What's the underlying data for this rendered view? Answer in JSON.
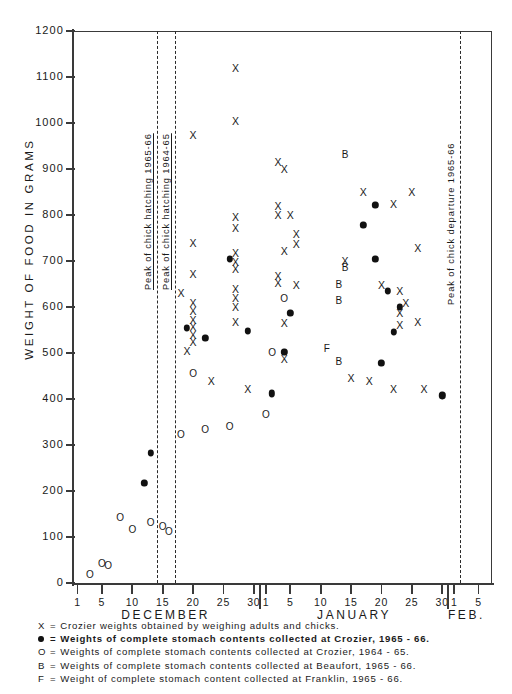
{
  "chart_data": {
    "type": "scatter",
    "title": "",
    "xlabel": "",
    "ylabel": "WEIGHT OF FOOD IN GRAMS",
    "ylim": [
      0,
      1200
    ],
    "ytick_step": 100,
    "yticks": [
      0,
      100,
      200,
      300,
      400,
      500,
      600,
      700,
      800,
      900,
      1000,
      1100,
      1200
    ],
    "ytick_labels": [
      "0",
      "100",
      "200",
      "300",
      "400",
      "500",
      "600",
      "700",
      "800",
      "900",
      "1000",
      "1100",
      "1200"
    ],
    "grid": false,
    "legend_position": "below-axes",
    "x_axis": {
      "months": [
        {
          "name": "DECEMBER",
          "ticks": [
            1,
            5,
            10,
            15,
            20,
            25,
            30
          ],
          "tick_labels": [
            "1",
            "5",
            "10",
            "15",
            "20",
            "25",
            "30"
          ]
        },
        {
          "name": "JANUARY",
          "ticks": [
            1,
            5,
            10,
            15,
            20,
            25,
            30
          ],
          "tick_labels": [
            "1",
            "5",
            "10",
            "15",
            "20",
            "25",
            "30"
          ]
        },
        {
          "name": "FEB.",
          "ticks": [
            1,
            5
          ],
          "tick_labels": [
            "1",
            "5"
          ]
        }
      ]
    },
    "annotations": [
      {
        "label": "Peak of chick hatching 1965-66",
        "x_day": 14,
        "month": "DECEMBER",
        "style": "dashed-vertical"
      },
      {
        "label": "Peak of chick hatching 1964-65",
        "x_day": 17,
        "month": "DECEMBER",
        "style": "dashed-vertical"
      },
      {
        "label": "Peak of chick departure 1965-66",
        "x_day": 2,
        "month": "FEBRUARY",
        "style": "dashed-vertical"
      }
    ],
    "series": [
      {
        "name": "X",
        "legend": "Crozier weights obtained by weighing adults and chicks.",
        "marker": "x",
        "points": [
          {
            "month": "DECEMBER",
            "day": 18,
            "value": 630
          },
          {
            "month": "DECEMBER",
            "day": 19,
            "value": 505
          },
          {
            "month": "DECEMBER",
            "day": 20,
            "value": 975
          },
          {
            "month": "DECEMBER",
            "day": 20,
            "value": 740
          },
          {
            "month": "DECEMBER",
            "day": 20,
            "value": 672
          },
          {
            "month": "DECEMBER",
            "day": 20,
            "value": 608
          },
          {
            "month": "DECEMBER",
            "day": 20,
            "value": 592
          },
          {
            "month": "DECEMBER",
            "day": 20,
            "value": 572
          },
          {
            "month": "DECEMBER",
            "day": 20,
            "value": 556
          },
          {
            "month": "DECEMBER",
            "day": 20,
            "value": 540
          },
          {
            "month": "DECEMBER",
            "day": 20,
            "value": 524
          },
          {
            "month": "DECEMBER",
            "day": 23,
            "value": 440
          },
          {
            "month": "DECEMBER",
            "day": 27,
            "value": 1120
          },
          {
            "month": "DECEMBER",
            "day": 27,
            "value": 1005
          },
          {
            "month": "DECEMBER",
            "day": 27,
            "value": 795
          },
          {
            "month": "DECEMBER",
            "day": 27,
            "value": 772
          },
          {
            "month": "DECEMBER",
            "day": 27,
            "value": 718
          },
          {
            "month": "DECEMBER",
            "day": 27,
            "value": 698
          },
          {
            "month": "DECEMBER",
            "day": 27,
            "value": 682
          },
          {
            "month": "DECEMBER",
            "day": 27,
            "value": 640
          },
          {
            "month": "DECEMBER",
            "day": 27,
            "value": 620
          },
          {
            "month": "DECEMBER",
            "day": 27,
            "value": 600
          },
          {
            "month": "DECEMBER",
            "day": 27,
            "value": 568
          },
          {
            "month": "DECEMBER",
            "day": 29,
            "value": 422
          },
          {
            "month": "JANUARY",
            "day": 3,
            "value": 915
          },
          {
            "month": "JANUARY",
            "day": 4,
            "value": 900
          },
          {
            "month": "JANUARY",
            "day": 3,
            "value": 820
          },
          {
            "month": "JANUARY",
            "day": 3,
            "value": 800
          },
          {
            "month": "JANUARY",
            "day": 5,
            "value": 800
          },
          {
            "month": "JANUARY",
            "day": 6,
            "value": 758
          },
          {
            "month": "JANUARY",
            "day": 6,
            "value": 738
          },
          {
            "month": "JANUARY",
            "day": 4,
            "value": 722
          },
          {
            "month": "JANUARY",
            "day": 3,
            "value": 668
          },
          {
            "month": "JANUARY",
            "day": 3,
            "value": 652
          },
          {
            "month": "JANUARY",
            "day": 6,
            "value": 648
          },
          {
            "month": "JANUARY",
            "day": 4,
            "value": 565
          },
          {
            "month": "JANUARY",
            "day": 4,
            "value": 488
          },
          {
            "month": "JANUARY",
            "day": 17,
            "value": 850
          },
          {
            "month": "JANUARY",
            "day": 14,
            "value": 700
          },
          {
            "month": "JANUARY",
            "day": 20,
            "value": 648
          },
          {
            "month": "JANUARY",
            "day": 22,
            "value": 825
          },
          {
            "month": "JANUARY",
            "day": 23,
            "value": 635
          },
          {
            "month": "JANUARY",
            "day": 24,
            "value": 608
          },
          {
            "month": "JANUARY",
            "day": 23,
            "value": 588
          },
          {
            "month": "JANUARY",
            "day": 23,
            "value": 560
          },
          {
            "month": "JANUARY",
            "day": 25,
            "value": 850
          },
          {
            "month": "JANUARY",
            "day": 26,
            "value": 728
          },
          {
            "month": "JANUARY",
            "day": 26,
            "value": 568
          },
          {
            "month": "JANUARY",
            "day": 27,
            "value": 422
          },
          {
            "month": "JANUARY",
            "day": 22,
            "value": 422
          },
          {
            "month": "JANUARY",
            "day": 18,
            "value": 440
          },
          {
            "month": "JANUARY",
            "day": 15,
            "value": 445
          }
        ]
      },
      {
        "name": "dot",
        "legend": "Weights of complete stomach contents collected at Crozier, 1965 - 66.",
        "marker": "filled-circle",
        "points": [
          {
            "month": "DECEMBER",
            "day": 12,
            "value": 218
          },
          {
            "month": "DECEMBER",
            "day": 13,
            "value": 282
          },
          {
            "month": "DECEMBER",
            "day": 19,
            "value": 555
          },
          {
            "month": "DECEMBER",
            "day": 22,
            "value": 532
          },
          {
            "month": "DECEMBER",
            "day": 26,
            "value": 705
          },
          {
            "month": "DECEMBER",
            "day": 29,
            "value": 548
          },
          {
            "month": "JANUARY",
            "day": 2,
            "value": 412
          },
          {
            "month": "JANUARY",
            "day": 4,
            "value": 502
          },
          {
            "month": "JANUARY",
            "day": 5,
            "value": 588
          },
          {
            "month": "JANUARY",
            "day": 19,
            "value": 822
          },
          {
            "month": "JANUARY",
            "day": 17,
            "value": 778
          },
          {
            "month": "JANUARY",
            "day": 19,
            "value": 705
          },
          {
            "month": "JANUARY",
            "day": 21,
            "value": 635
          },
          {
            "month": "JANUARY",
            "day": 23,
            "value": 600
          },
          {
            "month": "JANUARY",
            "day": 22,
            "value": 545
          },
          {
            "month": "JANUARY",
            "day": 20,
            "value": 478
          },
          {
            "month": "JANUARY",
            "day": 30,
            "value": 408
          }
        ]
      },
      {
        "name": "O",
        "legend": "Weights of complete stomach contents collected at Crozier, 1964 - 65.",
        "marker": "open-circle",
        "points": [
          {
            "month": "DECEMBER",
            "day": 3,
            "value": 18
          },
          {
            "month": "DECEMBER",
            "day": 5,
            "value": 42
          },
          {
            "month": "DECEMBER",
            "day": 6,
            "value": 36
          },
          {
            "month": "DECEMBER",
            "day": 8,
            "value": 142
          },
          {
            "month": "DECEMBER",
            "day": 10,
            "value": 115
          },
          {
            "month": "DECEMBER",
            "day": 13,
            "value": 130
          },
          {
            "month": "DECEMBER",
            "day": 15,
            "value": 122
          },
          {
            "month": "DECEMBER",
            "day": 16,
            "value": 110
          },
          {
            "month": "DECEMBER",
            "day": 18,
            "value": 322
          },
          {
            "month": "DECEMBER",
            "day": 20,
            "value": 455
          },
          {
            "month": "DECEMBER",
            "day": 22,
            "value": 332
          },
          {
            "month": "DECEMBER",
            "day": 26,
            "value": 340
          },
          {
            "month": "JANUARY",
            "day": 1,
            "value": 365
          },
          {
            "month": "JANUARY",
            "day": 2,
            "value": 500
          },
          {
            "month": "JANUARY",
            "day": 4,
            "value": 618
          }
        ]
      },
      {
        "name": "B",
        "legend": "Weights of complete stomach contents collected at Beaufort, 1965 - 66.",
        "marker": "letter-B",
        "points": [
          {
            "month": "JANUARY",
            "day": 14,
            "value": 930
          },
          {
            "month": "JANUARY",
            "day": 14,
            "value": 685
          },
          {
            "month": "JANUARY",
            "day": 13,
            "value": 612
          },
          {
            "month": "JANUARY",
            "day": 13,
            "value": 648
          },
          {
            "month": "JANUARY",
            "day": 13,
            "value": 480
          }
        ]
      },
      {
        "name": "F",
        "legend": "Weight of complete stomach content collected at Franklin, 1965 - 66.",
        "marker": "letter-F",
        "points": [
          {
            "month": "JANUARY",
            "day": 11,
            "value": 508
          }
        ]
      }
    ]
  },
  "axis": {
    "y_title": "WEIGHT OF FOOD IN GRAMS"
  },
  "legend": {
    "rows": [
      {
        "symbol": "X",
        "eq": "=",
        "text": "Crozier weights obtained by weighing adults and chicks."
      },
      {
        "symbol": "dot",
        "eq": "=",
        "text": "Weights of complete stomach contents collected at Crozier, 1965 - 66."
      },
      {
        "symbol": "O",
        "eq": "=",
        "text": "Weights of complete stomach contents collected at Crozier, 1964 - 65."
      },
      {
        "symbol": "B",
        "eq": "=",
        "text": "Weights of complete stomach contents collected at Beaufort, 1965 - 66."
      },
      {
        "symbol": "F",
        "eq": "=",
        "text": "Weight of complete stomach content collected at Franklin, 1965 - 66."
      }
    ]
  }
}
